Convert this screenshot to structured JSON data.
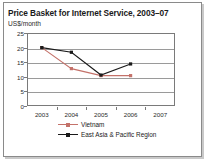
{
  "chart_data": {
    "type": "line",
    "title": "Price Basket for Internet Service, 2003–07",
    "subtitle": "US$/month",
    "xlabel": "",
    "ylabel": "US$/month",
    "categories": [
      "2003",
      "2004",
      "2005",
      "2006",
      "2007"
    ],
    "x_tick_labels": [
      "2003",
      "2004",
      "2005",
      "2006",
      "2007"
    ],
    "y_tick_labels": [
      "0",
      "5",
      "10",
      "15",
      "20",
      "25"
    ],
    "y_tick_values": [
      0,
      5,
      10,
      15,
      20,
      25
    ],
    "ylim": [
      0,
      25
    ],
    "grid": true,
    "legend_position": "bottom",
    "series": [
      {
        "name": "Vietnam",
        "color": "#C4726A",
        "marker": "square",
        "values": [
          20,
          12.8,
          10.4,
          10.4,
          null
        ]
      },
      {
        "name": "East Asia & Pacific Region",
        "color": "#1a1a1a",
        "marker": "square",
        "values": [
          20,
          18.4,
          10.6,
          14.4,
          null
        ]
      }
    ]
  },
  "legend": {
    "items": [
      {
        "label": "Vietnam",
        "color": "#C4726A"
      },
      {
        "label": "East Asia & Pacific Region",
        "color": "#1a1a1a"
      }
    ]
  }
}
